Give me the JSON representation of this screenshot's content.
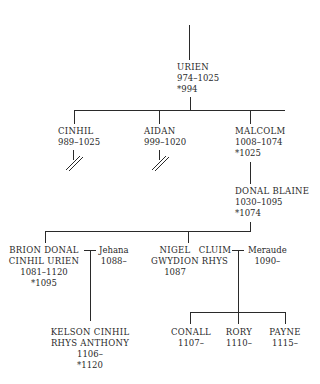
{
  "tree": {
    "root": {
      "name": "URIEN",
      "dates": "974–1025",
      "reign": "*994"
    },
    "gen2": [
      {
        "name": "CINHIL",
        "dates": "989–1025",
        "line_ended": true
      },
      {
        "name": "AIDAN",
        "dates": "999–1020",
        "line_ended": true
      },
      {
        "name": "MALCOLM",
        "dates": "1008–1074",
        "reign": "*1025"
      }
    ],
    "gen3": {
      "name": "DONAL BLAINE",
      "dates": "1030–1095",
      "reign": "*1074"
    },
    "gen4": [
      {
        "name_line1": "BRION DONAL",
        "name_line2": "CINHIL URIEN",
        "dates": "1081–1120",
        "reign": "*1095",
        "spouse": {
          "name": "Jehana",
          "dates": "1088–"
        }
      },
      {
        "name_line1": "NIGEL",
        "name_line2": "GWYDION",
        "dates": "1087"
      },
      {
        "name_line1": "CLUIM",
        "name_line2": "RHYS",
        "spouse": {
          "name": "Meraude",
          "dates": "1090–"
        }
      }
    ],
    "gen5_brion": {
      "name_line1": "KELSON CINHIL",
      "name_line2": "RHYS ANTHONY",
      "dates": "1106–",
      "reign": "*1120"
    },
    "gen5_rhys": [
      {
        "name": "CONALL",
        "dates": "1107–"
      },
      {
        "name": "RORY",
        "dates": "1110–"
      },
      {
        "name": "PAYNE",
        "dates": "1115–"
      }
    ]
  }
}
